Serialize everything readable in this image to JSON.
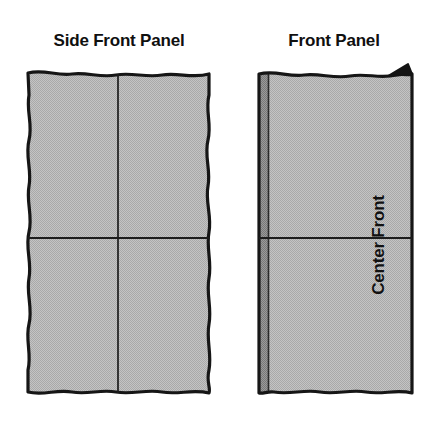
{
  "figure": {
    "kind": "sewing-pattern-diagram",
    "background_color": "#ffffff",
    "ink_color": "#1a1a1a",
    "fabric_fill_color": "#b9b9b9",
    "fabric_shadow_color": "#8c8c8c"
  },
  "panels": [
    {
      "id": "side-front-panel",
      "title": "Side Front Panel",
      "fill_color": "#b9b9b9",
      "outline_style": "wavy",
      "has_center_seam_marker": false,
      "has_corner_notch": false,
      "grid_lines": [
        "vertical-center",
        "horizontal-center"
      ]
    },
    {
      "id": "front-panel",
      "title": "Front Panel",
      "fill_color": "#b9b9b9",
      "outline_style": "wavy-top-and-bottom",
      "has_center_seam_marker": true,
      "has_corner_notch": true,
      "edge_label": "Center Front",
      "selvedge_color": "#8c8c8c",
      "grid_lines": [
        "horizontal-center"
      ]
    }
  ],
  "labels": {
    "side_front_panel_title": "Side Front Panel",
    "front_panel_title": "Front Panel",
    "center_front": "Center Front"
  }
}
